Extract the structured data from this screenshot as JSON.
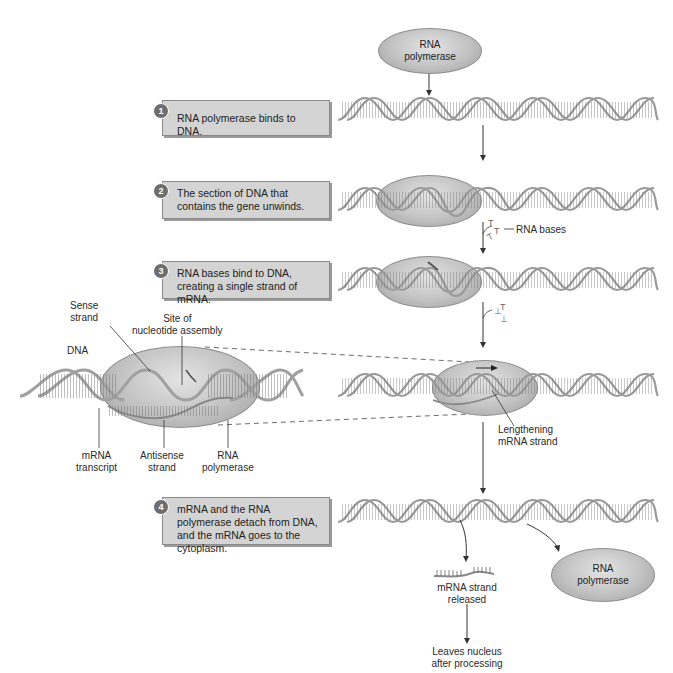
{
  "top_enzyme": {
    "line1": "RNA",
    "line2": "polymerase"
  },
  "steps": [
    {
      "number": "1",
      "text": "RNA polymerase binds to DNA."
    },
    {
      "number": "2",
      "text": "The section of DNA that contains the gene unwinds."
    },
    {
      "number": "3",
      "text": "RNA bases bind to DNA, creating a single strand of mRNA."
    },
    {
      "number": "4",
      "text": "mRNA and the RNA polymerase detach from DNA, and the mRNA goes to the cytoplasm."
    }
  ],
  "labels": {
    "rna_bases": "RNA bases",
    "lengthening_line1": "Lengthening",
    "lengthening_line2": "mRNA strand",
    "mrna_released_line1": "mRNA strand",
    "mrna_released_line2": "released",
    "leaves_line1": "Leaves nucleus",
    "leaves_line2": "after processing",
    "final_enzyme_line1": "RNA",
    "final_enzyme_line2": "polymerase"
  },
  "inset": {
    "sense_line1": "Sense",
    "sense_line2": "strand",
    "site_line1": "Site of",
    "site_line2": "nucleotide assembly",
    "dna": "DNA",
    "mrna_line1": "mRNA",
    "mrna_line2": "transcript",
    "antisense_line1": "Antisense",
    "antisense_line2": "strand",
    "polymerase_line1": "RNA",
    "polymerase_line2": "polymerase"
  },
  "colors": {
    "box_fill": "#d4d4d4",
    "box_border": "#8a8a8a",
    "step_badge": "#6e6e6e",
    "enzyme": "#c2c2c2",
    "helix": "#9a9a9a"
  }
}
